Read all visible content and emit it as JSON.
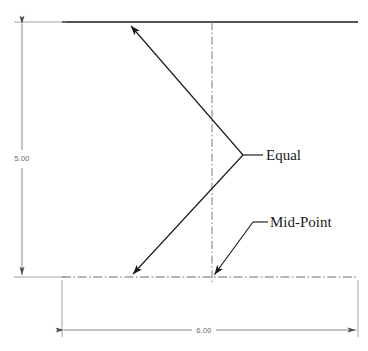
{
  "drawing": {
    "title": "Triangle construction dimensioned sketch",
    "background_color": "#ffffff",
    "line_color": "#1a1a1a",
    "dimension_color": "#6b6b6b",
    "centerline_color": "#7a7a7a",
    "dimensions": {
      "vertical": {
        "value": "5.00",
        "orientation": "vertical",
        "position": "left"
      },
      "horizontal": {
        "value": "6.00",
        "orientation": "horizontal",
        "position": "bottom"
      }
    },
    "annotations": {
      "equal": {
        "label": "Equal",
        "leader_target": "apex-vertex"
      },
      "midpoint": {
        "label": "Mid-Point",
        "leader_target": "base-centerline-intersection"
      }
    },
    "geometry": {
      "top_edge_y": 22,
      "bottom_edge_y": 277,
      "left_edge_x": 62,
      "right_edge_x": 358,
      "centerline_x": 212,
      "apex_x": 243,
      "apex_y": 155,
      "upper_arrow_tip_x": 128,
      "upper_arrow_tip_y": 23,
      "lower_arrow_tip_x": 130,
      "lower_arrow_tip_y": 277
    }
  }
}
